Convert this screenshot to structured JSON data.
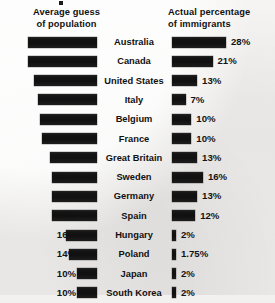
{
  "headers": {
    "left": [
      "Average guess",
      "of population"
    ],
    "right": [
      "Actual percentage",
      "of immigrants"
    ]
  },
  "colors": {
    "bar": "#151515",
    "background": "#f2f1ef",
    "text": "#121212"
  },
  "chart_data": {
    "type": "bar",
    "title": "",
    "subtitle": "",
    "orientation": "horizontal",
    "layout": "diverging-paired",
    "categories": [
      "Australia",
      "Canada",
      "United States",
      "Italy",
      "Belgium",
      "France",
      "Great Britain",
      "Sweden",
      "Germany",
      "Spain",
      "Hungary",
      "Poland",
      "Japan",
      "South Korea"
    ],
    "series": [
      {
        "name": "Average guess of population",
        "align": "right",
        "labels": [
          "35%",
          "35%",
          "32%",
          "30%",
          "29%",
          "28%",
          "24%",
          "23%",
          "23%",
          "23%",
          "16%",
          "14%",
          "10%",
          "10%"
        ],
        "values": [
          35,
          35,
          32,
          30,
          29,
          28,
          24,
          23,
          23,
          23,
          16,
          14,
          10,
          10
        ]
      },
      {
        "name": "Actual percentage of immigrants",
        "align": "left",
        "labels": [
          "28%",
          "21%",
          "13%",
          "7%",
          "10%",
          "10%",
          "13%",
          "16%",
          "13%",
          "12%",
          "2%",
          "1.75%",
          "2%",
          "2%"
        ],
        "values": [
          28,
          21,
          13,
          7,
          10,
          10,
          13,
          16,
          13,
          12,
          2,
          1.75,
          2,
          2
        ]
      }
    ],
    "xlabel": "",
    "ylabel": "",
    "grid": false,
    "legend_position": "top",
    "xlim": [
      0,
      35
    ]
  }
}
